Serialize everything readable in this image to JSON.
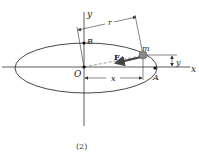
{
  "diagram": {
    "caption": "(2)",
    "axes": {
      "x_label": "x",
      "y_label": "y",
      "origin_label": "O"
    },
    "points": {
      "B": "B",
      "A": "A",
      "mass": "m"
    },
    "force_label": "F",
    "dimensions": {
      "r": "r",
      "x": "x",
      "y": "y"
    },
    "colors": {
      "line": "#333333",
      "mass_fill": "#8a8a8a",
      "force_arrow": "#444444"
    }
  }
}
